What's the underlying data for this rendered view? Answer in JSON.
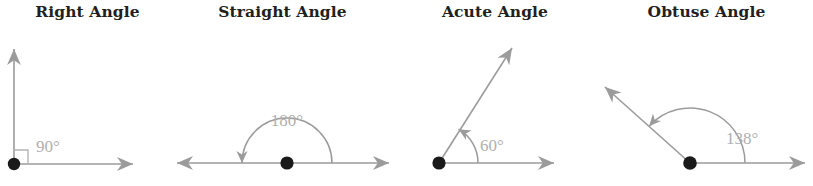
{
  "figure": {
    "caption_group": "Types of angles",
    "background_color": "#ffffff",
    "ray_color": "#999999",
    "vertex_color": "#1a1a1a",
    "label_color": "#b0b0b0",
    "title_color": "#231f20"
  },
  "panels": [
    {
      "id": "right-angle",
      "title": "Right Angle",
      "angle_label": "90°",
      "angle_value": 90,
      "marker": "square",
      "rays": [
        "east",
        "north"
      ]
    },
    {
      "id": "straight-angle",
      "title": "Straight Angle",
      "angle_label": "180°",
      "angle_value": 180,
      "marker": "arc",
      "rays": [
        "east",
        "west"
      ]
    },
    {
      "id": "acute-angle",
      "title": "Acute Angle",
      "angle_label": "60°",
      "angle_value": 60,
      "marker": "arc",
      "rays": [
        "east",
        "northeast"
      ]
    },
    {
      "id": "obtuse-angle",
      "title": "Obtuse Angle",
      "angle_label": "138°",
      "angle_value": 138,
      "marker": "arc",
      "rays": [
        "east",
        "northwest"
      ]
    }
  ]
}
